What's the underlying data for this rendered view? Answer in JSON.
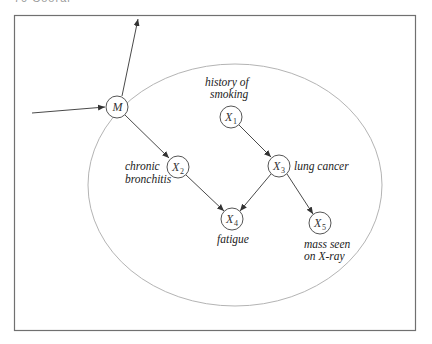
{
  "header": {
    "text": "70  Cooral"
  },
  "diagram": {
    "nodes": [
      {
        "id": "M",
        "label": "M",
        "sub": ""
      },
      {
        "id": "X1",
        "label": "X",
        "sub": "1",
        "desc": [
          "history of",
          "smoking"
        ]
      },
      {
        "id": "X2",
        "label": "X",
        "sub": "2",
        "desc": [
          "chronic",
          "bronchitis"
        ]
      },
      {
        "id": "X3",
        "label": "X",
        "sub": "3",
        "desc": [
          "lung cancer"
        ]
      },
      {
        "id": "X4",
        "label": "X",
        "sub": "4",
        "desc": [
          "fatigue"
        ]
      },
      {
        "id": "X5",
        "label": "X",
        "sub": "5",
        "desc": [
          "mass seen",
          "on X-ray"
        ]
      }
    ],
    "edges": [
      [
        "external-in",
        "M"
      ],
      [
        "M",
        "external-out"
      ],
      [
        "M",
        "X2"
      ],
      [
        "X1",
        "X3"
      ],
      [
        "X2",
        "X4"
      ],
      [
        "X3",
        "X4"
      ],
      [
        "X3",
        "X5"
      ]
    ]
  }
}
